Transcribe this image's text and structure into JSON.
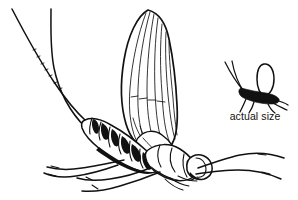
{
  "figure": {
    "kind": "scientific-line-illustration",
    "background_color": "#ffffff",
    "ink_color": "#111111",
    "width_px": 298,
    "height_px": 200
  },
  "labels": {
    "actual_size": "actual size"
  },
  "specimen": {
    "name": "mayfly-enlarged",
    "parts": {
      "forewing": "forewing",
      "hindwing": "hindwing",
      "thorax": "thorax",
      "abdomen": "abdomen",
      "head": "head",
      "eye": "compound-eye",
      "cerci": "tail-filaments",
      "legs": "legs"
    }
  },
  "scale_reference": {
    "name": "mayfly-actual-size-silhouette",
    "caption": "actual size"
  }
}
